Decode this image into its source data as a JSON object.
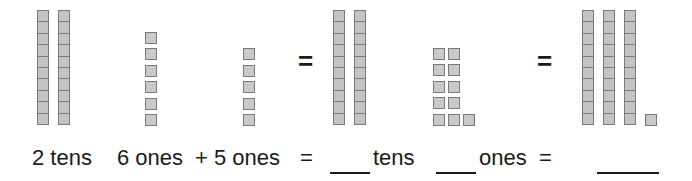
{
  "problem": {
    "tens_addend": {
      "count": 2,
      "label": "2 tens"
    },
    "ones_addend_a": {
      "count": 6,
      "label": "6 ones"
    },
    "plus": "+",
    "ones_addend_b": {
      "count": 5,
      "label": "5 ones"
    },
    "equals": "=",
    "regrouped": {
      "tens_count": 2,
      "ones_count": 11,
      "tens_label": "tens",
      "ones_label": "ones"
    },
    "result": {
      "tens_count": 3,
      "ones_count": 1
    },
    "answer_blanks": [
      "",
      "",
      ""
    ]
  },
  "colors": {
    "block_fill": "#c4c4c4",
    "block_border": "#7a7a7a",
    "text": "#1a1a1a"
  }
}
